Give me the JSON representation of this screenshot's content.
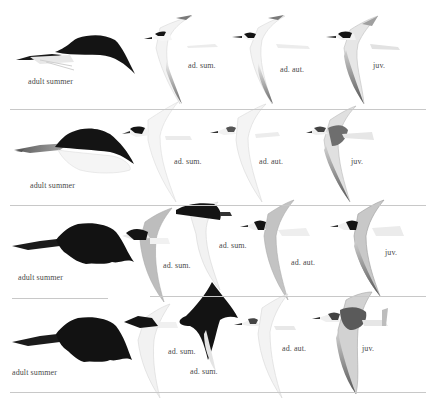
{
  "plate": {
    "rows": [
      {
        "head_label": "adult summer",
        "birds": [
          {
            "label": "ad. sum."
          },
          {
            "label": "ad. aut."
          },
          {
            "label": "juv."
          }
        ]
      },
      {
        "head_label": "adult summer",
        "birds": [
          {
            "label": "ad. sum."
          },
          {
            "label": "ad. aut."
          },
          {
            "label": "juv."
          }
        ]
      },
      {
        "head_label": "adult summer",
        "birds": [
          {
            "label": "ad. sum."
          },
          {
            "label": "ad. sum."
          },
          {
            "label": "ad. aut."
          },
          {
            "label": "juv."
          }
        ]
      },
      {
        "head_label": "adult summer",
        "birds": [
          {
            "label": "ad. sum."
          },
          {
            "label": "ad. sum."
          },
          {
            "label": "ad. aut."
          },
          {
            "label": "juv."
          }
        ]
      }
    ],
    "colors": {
      "background": "#ffffff",
      "cap_black": "#141414",
      "wing_grey": "#b9b9b9",
      "divider": "#c8c8c8",
      "label_text": "#4a4a4a"
    }
  }
}
